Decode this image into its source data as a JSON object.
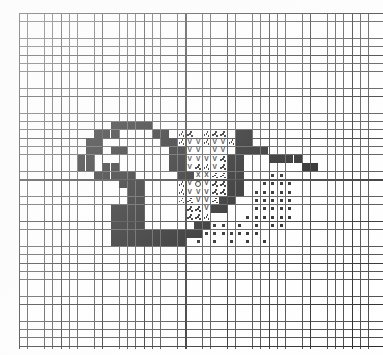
{
  "document": {
    "type": "cross-stitch-pattern-chart",
    "title": "Cross Stitch Pattern Chart",
    "description": "Graph-paper needlework chart depicting a bird figure rendered in filled and symbol-coded stitch cells",
    "background_color": "#ffffff",
    "ink_color": "#111111",
    "grid_line_color": "#4a4a4a",
    "grid_heavy_line_color": "#2b2b2b"
  },
  "grid": {
    "columns": 44,
    "rows": 41,
    "cell_size_px": 8.32,
    "heavy_line_every": 5,
    "origin_x_px": 19,
    "origin_y_px": 13
  },
  "legend": [
    {
      "key": "fill",
      "symbol": "█",
      "name": "solid-black-stitch"
    },
    {
      "key": "vee",
      "symbol": "V",
      "name": "vee-stitch"
    },
    {
      "key": "ex",
      "symbol": "X",
      "name": "cross-stitch"
    },
    {
      "key": "dot",
      "symbol": "▪",
      "name": "dot-stitch"
    },
    {
      "key": "ring",
      "symbol": "○",
      "name": "eye-ring-stitch"
    },
    {
      "key": "speck",
      "symbol": "∴",
      "name": "speckle-stitch"
    }
  ],
  "chart_data": {
    "type": "heatmap",
    "xlabel": "",
    "ylabel": "",
    "grid_on": true,
    "legend_position": "none",
    "columns": 44,
    "rows": 41,
    "symbol_key": {
      "0": "empty",
      "1": "fill",
      "2": "vee",
      "3": "ex",
      "4": "dot",
      "5": "ring",
      "6": "speck"
    },
    "cells": {
      "fill": [
        [
          11,
          13
        ],
        [
          12,
          13
        ],
        [
          13,
          13
        ],
        [
          14,
          13
        ],
        [
          15,
          13
        ],
        [
          10,
          14
        ],
        [
          11,
          14
        ],
        [
          16,
          14
        ],
        [
          17,
          14
        ],
        [
          26,
          14
        ],
        [
          27,
          14
        ],
        [
          9,
          14
        ],
        [
          8,
          15
        ],
        [
          9,
          15
        ],
        [
          17,
          15
        ],
        [
          18,
          15
        ],
        [
          26,
          15
        ],
        [
          27,
          15
        ],
        [
          8,
          16
        ],
        [
          9,
          16
        ],
        [
          11,
          16
        ],
        [
          12,
          16
        ],
        [
          18,
          16
        ],
        [
          19,
          16
        ],
        [
          26,
          16
        ],
        [
          27,
          16
        ],
        [
          28,
          16
        ],
        [
          29,
          16
        ],
        [
          7,
          17
        ],
        [
          8,
          17
        ],
        [
          18,
          17
        ],
        [
          19,
          17
        ],
        [
          25,
          17
        ],
        [
          26,
          17
        ],
        [
          30,
          17
        ],
        [
          31,
          17
        ],
        [
          32,
          17
        ],
        [
          33,
          17
        ],
        [
          7,
          18
        ],
        [
          8,
          18
        ],
        [
          10,
          18
        ],
        [
          11,
          18
        ],
        [
          18,
          18
        ],
        [
          19,
          18
        ],
        [
          25,
          18
        ],
        [
          26,
          18
        ],
        [
          34,
          18
        ],
        [
          35,
          18
        ],
        [
          9,
          19
        ],
        [
          10,
          19
        ],
        [
          11,
          19
        ],
        [
          12,
          19
        ],
        [
          13,
          19
        ],
        [
          19,
          19
        ],
        [
          20,
          19
        ],
        [
          25,
          19
        ],
        [
          26,
          19
        ],
        [
          12,
          20
        ],
        [
          13,
          20
        ],
        [
          14,
          20
        ],
        [
          25,
          20
        ],
        [
          26,
          20
        ],
        [
          13,
          21
        ],
        [
          14,
          21
        ],
        [
          25,
          21
        ],
        [
          26,
          21
        ],
        [
          13,
          22
        ],
        [
          14,
          22
        ],
        [
          24,
          22
        ],
        [
          25,
          22
        ],
        [
          11,
          23
        ],
        [
          12,
          23
        ],
        [
          13,
          23
        ],
        [
          14,
          23
        ],
        [
          23,
          23
        ],
        [
          24,
          23
        ],
        [
          11,
          24
        ],
        [
          12,
          24
        ],
        [
          13,
          24
        ],
        [
          14,
          24
        ],
        [
          11,
          25
        ],
        [
          12,
          25
        ],
        [
          13,
          25
        ],
        [
          14,
          25
        ],
        [
          21,
          25
        ],
        [
          22,
          25
        ],
        [
          11,
          26
        ],
        [
          12,
          26
        ],
        [
          13,
          26
        ],
        [
          14,
          26
        ],
        [
          15,
          26
        ],
        [
          16,
          26
        ],
        [
          17,
          26
        ],
        [
          18,
          26
        ],
        [
          19,
          26
        ],
        [
          20,
          26
        ],
        [
          21,
          26
        ],
        [
          11,
          27
        ],
        [
          12,
          27
        ],
        [
          13,
          27
        ],
        [
          14,
          27
        ],
        [
          15,
          27
        ],
        [
          16,
          27
        ],
        [
          17,
          27
        ],
        [
          18,
          27
        ],
        [
          19,
          27
        ]
      ],
      "vee": [
        [
          20,
          15
        ],
        [
          21,
          15
        ],
        [
          23,
          15
        ],
        [
          24,
          15
        ],
        [
          20,
          16
        ],
        [
          21,
          16
        ],
        [
          23,
          16
        ],
        [
          24,
          16
        ],
        [
          20,
          17
        ],
        [
          21,
          17
        ],
        [
          22,
          17
        ],
        [
          23,
          17
        ],
        [
          20,
          18
        ],
        [
          23,
          18
        ],
        [
          20,
          20
        ],
        [
          21,
          20
        ],
        [
          22,
          20
        ],
        [
          20,
          21
        ],
        [
          21,
          21
        ],
        [
          22,
          21
        ],
        [
          21,
          22
        ],
        [
          22,
          22
        ],
        [
          22,
          23
        ]
      ],
      "ex": [
        [
          21,
          19
        ],
        [
          22,
          19
        ]
      ],
      "ring": [
        [
          21,
          20
        ]
      ],
      "dot": [
        [
          30,
          19
        ],
        [
          31,
          19
        ],
        [
          29,
          20
        ],
        [
          30,
          20
        ],
        [
          31,
          20
        ],
        [
          32,
          20
        ],
        [
          29,
          21
        ],
        [
          30,
          21
        ],
        [
          31,
          21
        ],
        [
          32,
          21
        ],
        [
          28,
          21
        ],
        [
          29,
          22
        ],
        [
          30,
          22
        ],
        [
          31,
          22
        ],
        [
          32,
          22
        ],
        [
          28,
          22
        ],
        [
          29,
          23
        ],
        [
          30,
          23
        ],
        [
          31,
          23
        ],
        [
          32,
          23
        ],
        [
          28,
          23
        ],
        [
          29,
          24
        ],
        [
          30,
          24
        ],
        [
          31,
          24
        ],
        [
          32,
          24
        ],
        [
          28,
          24
        ],
        [
          27,
          24
        ],
        [
          22,
          25
        ],
        [
          23,
          25
        ],
        [
          24,
          25
        ],
        [
          26,
          25
        ],
        [
          28,
          25
        ],
        [
          30,
          25
        ],
        [
          31,
          25
        ],
        [
          20,
          26
        ],
        [
          21,
          26
        ],
        [
          22,
          26
        ],
        [
          23,
          26
        ],
        [
          24,
          26
        ],
        [
          25,
          26
        ],
        [
          26,
          26
        ],
        [
          27,
          26
        ],
        [
          28,
          26
        ],
        [
          21,
          27
        ],
        [
          23,
          27
        ],
        [
          25,
          27
        ],
        [
          27,
          27
        ],
        [
          29,
          27
        ]
      ],
      "speck": [
        [
          19,
          14
        ],
        [
          20,
          14
        ],
        [
          22,
          14
        ],
        [
          23,
          14
        ],
        [
          24,
          14
        ],
        [
          19,
          15
        ],
        [
          22,
          15
        ],
        [
          25,
          15
        ],
        [
          19,
          17
        ],
        [
          24,
          17
        ],
        [
          25,
          17
        ],
        [
          19,
          18
        ],
        [
          21,
          18
        ],
        [
          22,
          18
        ],
        [
          24,
          18
        ],
        [
          25,
          18
        ],
        [
          19,
          19
        ],
        [
          20,
          19
        ],
        [
          23,
          19
        ],
        [
          24,
          19
        ],
        [
          19,
          20
        ],
        [
          23,
          20
        ],
        [
          24,
          20
        ],
        [
          19,
          21
        ],
        [
          23,
          21
        ],
        [
          24,
          21
        ],
        [
          19,
          22
        ],
        [
          20,
          22
        ],
        [
          23,
          22
        ],
        [
          20,
          23
        ],
        [
          21,
          23
        ],
        [
          20,
          24
        ],
        [
          21,
          24
        ],
        [
          22,
          24
        ]
      ]
    }
  }
}
